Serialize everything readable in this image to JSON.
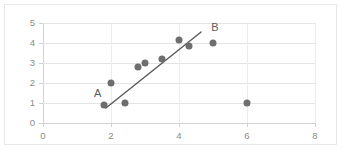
{
  "chart_data": {
    "type": "scatter",
    "title": "",
    "xlabel": "",
    "ylabel": "",
    "xlim": [
      0,
      8
    ],
    "ylim": [
      0,
      5
    ],
    "xticks": [
      "0",
      "2",
      "4",
      "6",
      "8"
    ],
    "xtick_values": [
      0,
      2,
      4,
      6,
      8
    ],
    "yticks": [
      "0",
      "1",
      "2",
      "3",
      "4",
      "5"
    ],
    "ytick_values": [
      0,
      1,
      2,
      3,
      4,
      5
    ],
    "grid": "horizontal-and-vertical",
    "legend": "none",
    "marker_color": "#6e6e6e",
    "line_color": "#595959",
    "gridline_color": "#e4e4e4",
    "axis_color": "#d2d2d2",
    "tick_label_color": "#8a8a8a",
    "points": [
      {
        "x": 1.8,
        "y": 0.9
      },
      {
        "x": 2.0,
        "y": 2.0
      },
      {
        "x": 2.4,
        "y": 1.0
      },
      {
        "x": 2.8,
        "y": 2.8
      },
      {
        "x": 3.0,
        "y": 3.0
      },
      {
        "x": 3.5,
        "y": 3.2
      },
      {
        "x": 4.0,
        "y": 4.15
      },
      {
        "x": 4.3,
        "y": 3.85
      },
      {
        "x": 5.0,
        "y": 4.0
      },
      {
        "x": 6.0,
        "y": 1.0
      }
    ],
    "annotations": [
      {
        "label": "A",
        "name": "line-endpoint-a",
        "x": 1.85,
        "y": 0.75,
        "label_x": 1.5,
        "label_y": 1.45
      },
      {
        "label": "B",
        "name": "line-endpoint-b",
        "x": 4.65,
        "y": 4.55,
        "label_x": 4.95,
        "label_y": 4.75
      }
    ],
    "line": {
      "name": "trend-line-ab",
      "x1": 1.85,
      "y1": 0.75,
      "x2": 4.65,
      "y2": 4.55,
      "width": 1.4
    }
  }
}
